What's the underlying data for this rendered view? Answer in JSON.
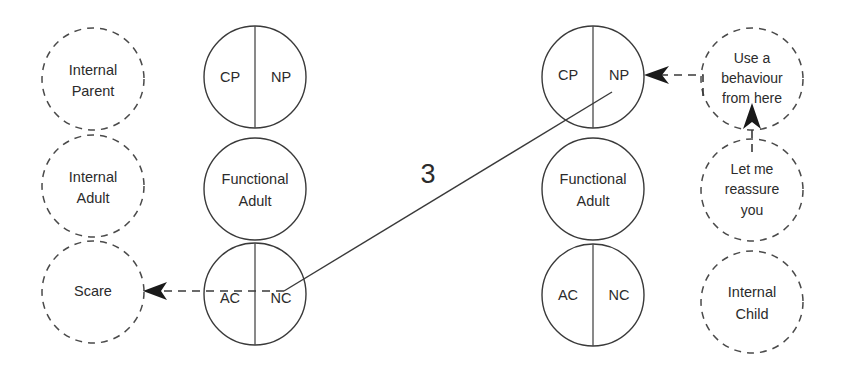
{
  "diagram": {
    "background_color": "#ffffff",
    "solid_stroke_color": "#3a3a3a",
    "dashed_stroke_color": "#4a4a4a",
    "text_color": "#2b2b2b"
  },
  "left_internal_column": {
    "parent": {
      "line1": "Internal",
      "line2": "Parent"
    },
    "adult": {
      "line1": "Internal",
      "line2": "Adult"
    },
    "child": {
      "line1": "Scare",
      "line2": ""
    }
  },
  "left_functional_column": {
    "parent": {
      "left": "CP",
      "right": "NP"
    },
    "adult": {
      "line1": "Functional",
      "line2": "Adult"
    },
    "child": {
      "left": "AC",
      "right": "NC"
    }
  },
  "right_functional_column": {
    "parent": {
      "left": "CP",
      "right": "NP"
    },
    "adult": {
      "line1": "Functional",
      "line2": "Adult"
    },
    "child": {
      "left": "AC",
      "right": "NC"
    }
  },
  "right_internal_column": {
    "parent": {
      "line1": "Use a",
      "line2": "behaviour",
      "line3": "from here"
    },
    "adult": {
      "line1": "Let me",
      "line2": "reassure",
      "line3": "you"
    },
    "child": {
      "line1": "Internal",
      "line2": "Child"
    }
  },
  "transaction": {
    "number_label": "3"
  }
}
